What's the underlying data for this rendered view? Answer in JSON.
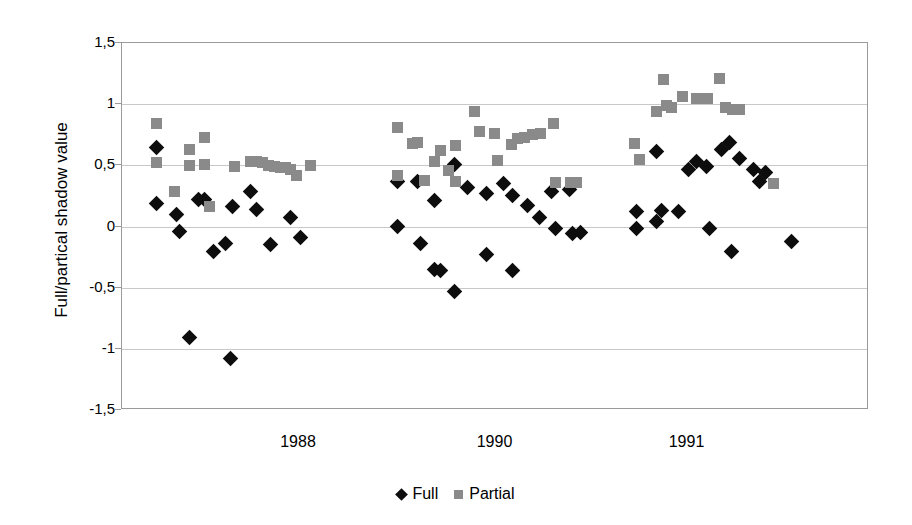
{
  "chart_data": {
    "type": "scatter",
    "title": "",
    "xlabel": "",
    "ylabel": "Full/partical shadow value",
    "ylim": [
      -1.5,
      1.5
    ],
    "yticks": [
      1.5,
      1,
      0.5,
      0,
      -0.5,
      -1,
      -1.5
    ],
    "ytick_labels": [
      "1,5",
      "1",
      "0,5",
      "0",
      "-0,5",
      "-1",
      "-1,5"
    ],
    "xtick_labels": [
      "1988",
      "1990",
      "1991"
    ],
    "xtick_positions": [
      0.237,
      0.5,
      0.757
    ],
    "grid": "horizontal",
    "legend_position": "bottom-center",
    "series": [
      {
        "name": "Full",
        "marker": "diamond",
        "color": "#0d0d0d",
        "points": [
          {
            "x": 0.0455,
            "y": 0.65
          },
          {
            "x": 0.0455,
            "y": 0.19
          },
          {
            "x": 0.0723,
            "y": 0.1
          },
          {
            "x": 0.0763,
            "y": -0.04
          },
          {
            "x": 0.1018,
            "y": 0.22
          },
          {
            "x": 0.1098,
            "y": 0.22
          },
          {
            "x": 0.1219,
            "y": -0.2
          },
          {
            "x": 0.138,
            "y": -0.14
          },
          {
            "x": 0.1473,
            "y": 0.16
          },
          {
            "x": 0.1714,
            "y": 0.29
          },
          {
            "x": 0.1794,
            "y": 0.14
          },
          {
            "x": 0.1982,
            "y": -0.15
          },
          {
            "x": 0.225,
            "y": 0.07
          },
          {
            "x": 0.2384,
            "y": -0.09
          },
          {
            "x": 0.0897,
            "y": -0.91
          },
          {
            "x": 0.1446,
            "y": -1.08
          },
          {
            "x": 0.3681,
            "y": 0.37
          },
          {
            "x": 0.3681,
            "y": 0.0
          },
          {
            "x": 0.3949,
            "y": 0.37
          },
          {
            "x": 0.3989,
            "y": -0.14
          },
          {
            "x": 0.4177,
            "y": 0.21
          },
          {
            "x": 0.4177,
            "y": -0.35
          },
          {
            "x": 0.4257,
            "y": -0.36
          },
          {
            "x": 0.4444,
            "y": 0.51
          },
          {
            "x": 0.4444,
            "y": -0.53
          },
          {
            "x": 0.4619,
            "y": 0.32
          },
          {
            "x": 0.4873,
            "y": 0.27
          },
          {
            "x": 0.4873,
            "y": -0.23
          },
          {
            "x": 0.5101,
            "y": 0.35
          },
          {
            "x": 0.5221,
            "y": 0.25
          },
          {
            "x": 0.5221,
            "y": -0.36
          },
          {
            "x": 0.5422,
            "y": 0.17
          },
          {
            "x": 0.5583,
            "y": 0.07
          },
          {
            "x": 0.5744,
            "y": 0.29
          },
          {
            "x": 0.5797,
            "y": -0.02
          },
          {
            "x": 0.5985,
            "y": 0.3
          },
          {
            "x": 0.6025,
            "y": -0.06
          },
          {
            "x": 0.6132,
            "y": -0.05
          },
          {
            "x": 0.6882,
            "y": 0.12
          },
          {
            "x": 0.6882,
            "y": -0.02
          },
          {
            "x": 0.715,
            "y": 0.61
          },
          {
            "x": 0.715,
            "y": 0.04
          },
          {
            "x": 0.7217,
            "y": 0.13
          },
          {
            "x": 0.7445,
            "y": 0.12
          },
          {
            "x": 0.7579,
            "y": 0.47
          },
          {
            "x": 0.7686,
            "y": 0.53
          },
          {
            "x": 0.782,
            "y": 0.49
          },
          {
            "x": 0.786,
            "y": -0.02
          },
          {
            "x": 0.8021,
            "y": 0.63
          },
          {
            "x": 0.8128,
            "y": 0.69
          },
          {
            "x": 0.8155,
            "y": -0.2
          },
          {
            "x": 0.8262,
            "y": 0.56
          },
          {
            "x": 0.8449,
            "y": 0.47
          },
          {
            "x": 0.853,
            "y": 0.37
          },
          {
            "x": 0.861,
            "y": 0.44
          },
          {
            "x": 0.8959,
            "y": -0.12
          }
        ]
      },
      {
        "name": "Partial",
        "marker": "square",
        "color": "#8a8a8a",
        "points": [
          {
            "x": 0.0455,
            "y": 0.84
          },
          {
            "x": 0.0455,
            "y": 0.52
          },
          {
            "x": 0.0696,
            "y": 0.29
          },
          {
            "x": 0.0897,
            "y": 0.63
          },
          {
            "x": 0.0897,
            "y": 0.5
          },
          {
            "x": 0.1098,
            "y": 0.73
          },
          {
            "x": 0.1098,
            "y": 0.51
          },
          {
            "x": 0.1165,
            "y": 0.16
          },
          {
            "x": 0.15,
            "y": 0.49
          },
          {
            "x": 0.1714,
            "y": 0.53
          },
          {
            "x": 0.1794,
            "y": 0.53
          },
          {
            "x": 0.1875,
            "y": 0.52
          },
          {
            "x": 0.1955,
            "y": 0.5
          },
          {
            "x": 0.2036,
            "y": 0.49
          },
          {
            "x": 0.2116,
            "y": 0.48
          },
          {
            "x": 0.2183,
            "y": 0.48
          },
          {
            "x": 0.225,
            "y": 0.47
          },
          {
            "x": 0.233,
            "y": 0.42
          },
          {
            "x": 0.2518,
            "y": 0.5
          },
          {
            "x": 0.3681,
            "y": 0.81
          },
          {
            "x": 0.3681,
            "y": 0.42
          },
          {
            "x": 0.3882,
            "y": 0.68
          },
          {
            "x": 0.3949,
            "y": 0.69
          },
          {
            "x": 0.4043,
            "y": 0.38
          },
          {
            "x": 0.4177,
            "y": 0.53
          },
          {
            "x": 0.4257,
            "y": 0.62
          },
          {
            "x": 0.4364,
            "y": 0.46
          },
          {
            "x": 0.4458,
            "y": 0.66
          },
          {
            "x": 0.4458,
            "y": 0.37
          },
          {
            "x": 0.4712,
            "y": 0.94
          },
          {
            "x": 0.4779,
            "y": 0.78
          },
          {
            "x": 0.498,
            "y": 0.76
          },
          {
            "x": 0.502,
            "y": 0.54
          },
          {
            "x": 0.5208,
            "y": 0.67
          },
          {
            "x": 0.5288,
            "y": 0.72
          },
          {
            "x": 0.5382,
            "y": 0.73
          },
          {
            "x": 0.5489,
            "y": 0.75
          },
          {
            "x": 0.5596,
            "y": 0.76
          },
          {
            "x": 0.577,
            "y": 0.84
          },
          {
            "x": 0.5797,
            "y": 0.36
          },
          {
            "x": 0.5998,
            "y": 0.36
          },
          {
            "x": 0.6078,
            "y": 0.36
          },
          {
            "x": 0.6865,
            "y": 0.68
          },
          {
            "x": 0.6932,
            "y": 0.55
          },
          {
            "x": 0.7243,
            "y": 1.2
          },
          {
            "x": 0.715,
            "y": 0.94
          },
          {
            "x": 0.7284,
            "y": 0.99
          },
          {
            "x": 0.7351,
            "y": 0.97
          },
          {
            "x": 0.7498,
            "y": 1.06
          },
          {
            "x": 0.7686,
            "y": 1.05
          },
          {
            "x": 0.7833,
            "y": 1.05
          },
          {
            "x": 0.7994,
            "y": 1.21
          },
          {
            "x": 0.8075,
            "y": 0.97
          },
          {
            "x": 0.8168,
            "y": 0.96
          },
          {
            "x": 0.8262,
            "y": 0.96
          },
          {
            "x": 0.8717,
            "y": 0.35
          }
        ]
      }
    ]
  },
  "legend": {
    "entries": [
      {
        "label": "Full",
        "marker": "diamond-icon",
        "color": "#0d0d0d"
      },
      {
        "label": "Partial",
        "marker": "square-icon",
        "color": "#8a8a8a"
      }
    ]
  }
}
